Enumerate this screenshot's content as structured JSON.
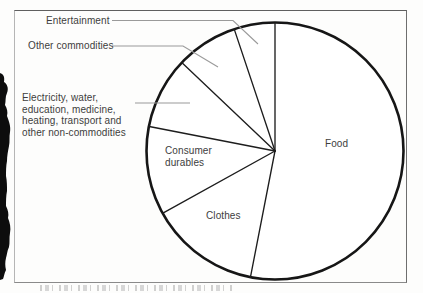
{
  "figure": {
    "kind": "scanned textbook pie-chart figure",
    "frame_border": true,
    "colors": {
      "pie_outline": "#161616",
      "slice_divider": "#1d1d1d",
      "leader_line": "#9a9a9a",
      "label_text": "#3d3d3d",
      "background": "#fdfdfc",
      "scan_artifact": "#0d0d0d"
    }
  },
  "display": {
    "labels": {
      "entertainment": "Entertainment",
      "other_commodities": "Other commodities",
      "electricity_lines": [
        "Electricity, water,",
        "education, medicine,",
        "heating, transport and",
        "other non-commodities"
      ],
      "consumer_lines": [
        "Consumer",
        "durables"
      ],
      "clothes": "Clothes",
      "food": "Food"
    }
  },
  "chart_data": {
    "type": "pie",
    "style": "outline-only, white fill, black strokes, no numeric value labels shown",
    "rotation": "first boundary at 12 o'clock, slices ordered clockwise",
    "slices": [
      {
        "label": "Food",
        "start_angle_deg": 0,
        "end_angle_deg": 191,
        "percent_estimate": 53,
        "label_placement": "inside"
      },
      {
        "label": "Clothes",
        "start_angle_deg": 191,
        "end_angle_deg": 241,
        "percent_estimate": 14,
        "label_placement": "inside"
      },
      {
        "label": "Consumer durables",
        "start_angle_deg": 241,
        "end_angle_deg": 281,
        "percent_estimate": 11,
        "label_placement": "inside"
      },
      {
        "label": "Electricity, water, education, medicine, heating, transport and other non-commodities",
        "start_angle_deg": 281,
        "end_angle_deg": 313.5,
        "percent_estimate": 9,
        "label_placement": "callout-left"
      },
      {
        "label": "Other commodities",
        "start_angle_deg": 313.5,
        "end_angle_deg": 341.5,
        "percent_estimate": 8,
        "label_placement": "callout-left"
      },
      {
        "label": "Entertainment",
        "start_angle_deg": 341.5,
        "end_angle_deg": 360,
        "percent_estimate": 5,
        "label_placement": "callout-top"
      }
    ],
    "title": "",
    "legend_position": "none (direct labels with leader lines)"
  }
}
